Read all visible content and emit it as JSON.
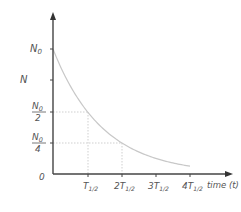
{
  "chart_data": {
    "type": "line",
    "title": "",
    "xlabel": "time (t)",
    "ylabel": "N",
    "x_ticks": [
      {
        "main": "T",
        "sub": "1/2",
        "prefix": "",
        "value": 1
      },
      {
        "main": "T",
        "sub": "1/2",
        "prefix": "2",
        "value": 2
      },
      {
        "main": "T",
        "sub": "1/2",
        "prefix": "3",
        "value": 3
      },
      {
        "main": "T",
        "sub": "1/2",
        "prefix": "4",
        "value": 4
      }
    ],
    "y_ticks": [
      {
        "label": "N0",
        "value": 1.0
      },
      {
        "label": "N0/2",
        "value": 0.5
      },
      {
        "label": "N0/4",
        "value": 0.25
      }
    ],
    "origin_label": "0",
    "series": [
      {
        "name": "N(t) = N0 · (1/2)^(t/T1/2)",
        "x": [
          0,
          0.5,
          1,
          1.5,
          2,
          2.5,
          3,
          3.5,
          4
        ],
        "y": [
          1.0,
          0.707,
          0.5,
          0.354,
          0.25,
          0.177,
          0.125,
          0.088,
          0.0625
        ]
      }
    ],
    "guides": [
      {
        "x": 1,
        "y": 0.5
      },
      {
        "x": 2,
        "y": 0.25
      }
    ],
    "xlim": [
      0,
      4.3
    ],
    "ylim": [
      0,
      1.25
    ],
    "grid": false,
    "legend": null
  },
  "labels": {
    "y_axis": "N",
    "x_axis": "time (t)",
    "origin": "0",
    "n0": "N",
    "n0_sub": "0",
    "two": "2",
    "four": "4",
    "t": "T",
    "half_sub": "1/2",
    "p2": "2",
    "p3": "3",
    "p4": "4"
  },
  "colors": {
    "axis": "#444444",
    "curve": "#c8c8c8",
    "guide": "#cfcfcf",
    "text": "#555555"
  }
}
